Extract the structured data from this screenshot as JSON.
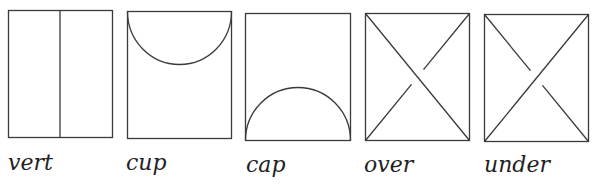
{
  "diagram": {
    "stroke_color": "#3a3a3a",
    "background": "#ffffff",
    "panels": [
      {
        "id": "vert",
        "label": "vert",
        "kind": "vertical-line"
      },
      {
        "id": "cup",
        "label": "cup",
        "kind": "cup-arc"
      },
      {
        "id": "cap",
        "label": "cap",
        "kind": "cap-arc"
      },
      {
        "id": "over",
        "label": "over",
        "kind": "crossing-over"
      },
      {
        "id": "under",
        "label": "under",
        "kind": "crossing-under"
      }
    ]
  }
}
